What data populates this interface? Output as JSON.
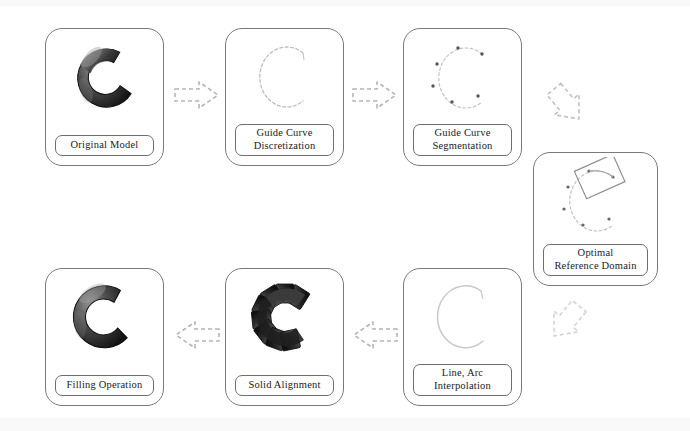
{
  "figure": {
    "type": "process-flow-diagram",
    "title": "",
    "background_color": "#ffffff",
    "stroke_color": "#7a7a7a",
    "text_color": "#1b1b1b"
  },
  "nodes": [
    {
      "id": "original-model",
      "label_lines": [
        "Original Model"
      ],
      "thumbnail": "solid-c-torus-shaded",
      "x": 45,
      "y": 28,
      "w": 119,
      "h": 138
    },
    {
      "id": "guide-curve-discretization",
      "label_lines": [
        "Guide Curve",
        "Discretization"
      ],
      "thumbnail": "faint-c-curve",
      "x": 225,
      "y": 28,
      "w": 119,
      "h": 138
    },
    {
      "id": "guide-curve-segmentation",
      "label_lines": [
        "Guide Curve",
        "Segmentation"
      ],
      "thumbnail": "c-curve-with-segment-points",
      "x": 403,
      "y": 28,
      "w": 119,
      "h": 138
    },
    {
      "id": "optimal-reference-domain",
      "label_lines": [
        "Optimal",
        "Reference Domain"
      ],
      "thumbnail": "c-curve-with-tilted-rectangle",
      "x": 533,
      "y": 152,
      "w": 125,
      "h": 134
    },
    {
      "id": "line-arc-interpolation",
      "label_lines": [
        "Line, Arc",
        "Interpolation"
      ],
      "thumbnail": "faint-c-curve",
      "x": 403,
      "y": 268,
      "w": 119,
      "h": 138
    },
    {
      "id": "solid-alignment",
      "label_lines": [
        "Solid Alignment"
      ],
      "thumbnail": "segmented-c-blocks",
      "x": 225,
      "y": 268,
      "w": 119,
      "h": 138
    },
    {
      "id": "filling-operation",
      "label_lines": [
        "Filling Operation"
      ],
      "thumbnail": "solid-c-filled-shaded",
      "x": 45,
      "y": 268,
      "w": 119,
      "h": 138
    }
  ],
  "arrows": [
    {
      "id": "arrow-original-to-discretization",
      "direction": "right",
      "x": 172,
      "y": 78
    },
    {
      "id": "arrow-discretization-to-segmentation",
      "direction": "right",
      "x": 350,
      "y": 78
    },
    {
      "id": "arrow-segmentation-to-domain",
      "direction": "down-right",
      "x": 540,
      "y": 78
    },
    {
      "id": "arrow-domain-to-interpolation",
      "direction": "down-left",
      "x": 537,
      "y": 295
    },
    {
      "id": "arrow-interpolation-to-alignment",
      "direction": "left",
      "x": 350,
      "y": 318
    },
    {
      "id": "arrow-alignment-to-filling",
      "direction": "left",
      "x": 172,
      "y": 318
    }
  ]
}
